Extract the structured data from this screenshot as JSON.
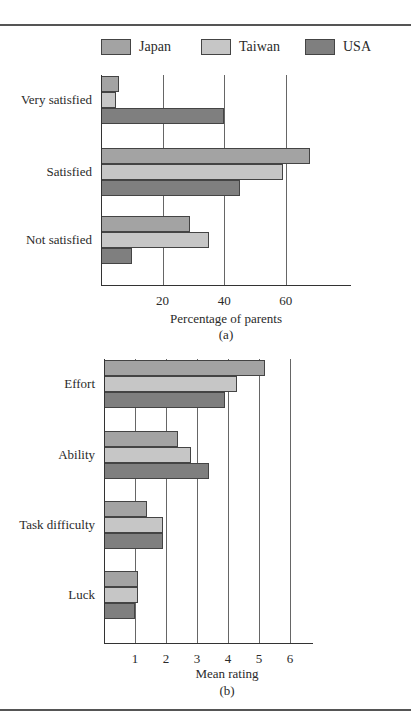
{
  "colors": {
    "Japan": "#a3a3a3",
    "Taiwan": "#c6c6c6",
    "USA": "#7f7f7f"
  },
  "legend": [
    {
      "label": "Japan",
      "color": "#a3a3a3"
    },
    {
      "label": "Taiwan",
      "color": "#c6c6c6"
    },
    {
      "label": "USA",
      "color": "#7f7f7f"
    }
  ],
  "chart_data": [
    {
      "type": "bar",
      "orientation": "horizontal",
      "panel": "(a)",
      "title": "",
      "xlabel": "Percentage of parents",
      "ylabel": "",
      "xlim": [
        0,
        80
      ],
      "xticks": [
        20,
        40,
        60
      ],
      "grid": true,
      "legend_position": "top",
      "categories": [
        "Very satisfied",
        "Satisfied",
        "Not satisfied"
      ],
      "series": [
        {
          "name": "Japan",
          "values": [
            6,
            68,
            29
          ]
        },
        {
          "name": "Taiwan",
          "values": [
            5,
            59,
            35
          ]
        },
        {
          "name": "USA",
          "values": [
            40,
            45,
            10
          ]
        }
      ]
    },
    {
      "type": "bar",
      "orientation": "horizontal",
      "panel": "(b)",
      "title": "",
      "xlabel": "Mean rating",
      "ylabel": "",
      "xlim": [
        0,
        7
      ],
      "xticks": [
        1,
        2,
        3,
        4,
        5,
        6
      ],
      "grid": true,
      "legend_position": "top",
      "categories": [
        "Effort",
        "Ability",
        "Task difficulty",
        "Luck"
      ],
      "series": [
        {
          "name": "Japan",
          "values": [
            5.2,
            2.4,
            1.4,
            1.1
          ]
        },
        {
          "name": "Taiwan",
          "values": [
            4.3,
            2.8,
            1.9,
            1.1
          ]
        },
        {
          "name": "USA",
          "values": [
            3.9,
            3.4,
            1.9,
            1.0
          ]
        }
      ]
    }
  ]
}
